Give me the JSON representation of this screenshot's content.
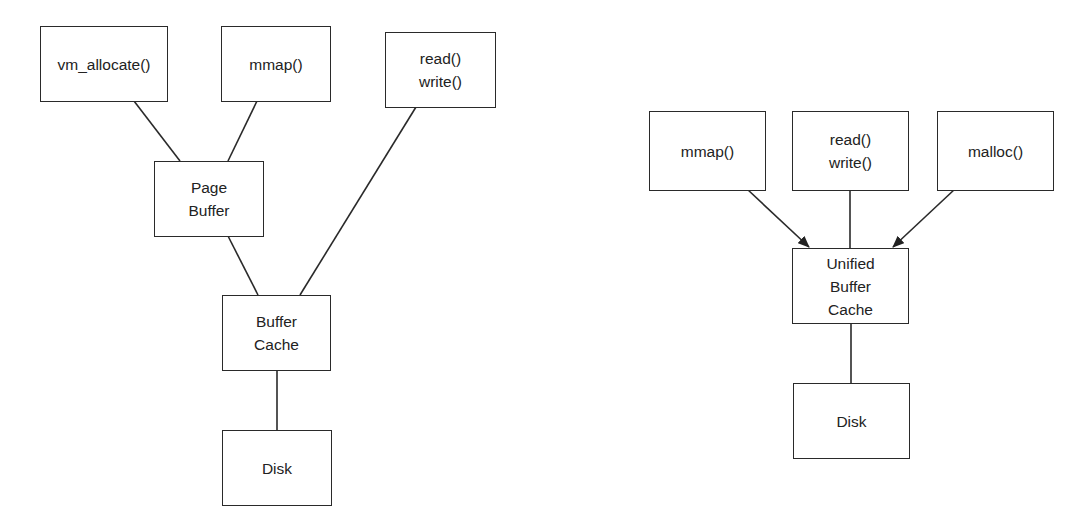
{
  "left_diagram": {
    "nodes": {
      "vm_allocate": {
        "label": "vm_allocate()",
        "x": 40,
        "y": 26,
        "w": 128,
        "h": 76
      },
      "mmap": {
        "label": "mmap()",
        "x": 221,
        "y": 26,
        "w": 110,
        "h": 76
      },
      "readwrite": {
        "label1": "read()",
        "label2": "write()",
        "x": 385,
        "y": 32,
        "w": 111,
        "h": 76
      },
      "page_buffer": {
        "label1": "Page",
        "label2": "Buffer",
        "x": 154,
        "y": 161,
        "w": 110,
        "h": 76
      },
      "buffer_cache": {
        "label1": "Buffer",
        "label2": "Cache",
        "x": 222,
        "y": 295,
        "w": 109,
        "h": 76
      },
      "disk": {
        "label": "Disk",
        "x": 222,
        "y": 430,
        "w": 110,
        "h": 76
      }
    }
  },
  "right_diagram": {
    "nodes": {
      "mmap": {
        "label": "mmap()",
        "x": 649,
        "y": 111,
        "w": 117,
        "h": 80
      },
      "readwrite": {
        "label1": "read()",
        "label2": "write()",
        "x": 792,
        "y": 111,
        "w": 117,
        "h": 80
      },
      "malloc": {
        "label": "malloc()",
        "x": 937,
        "y": 111,
        "w": 117,
        "h": 80
      },
      "unified": {
        "label1": "Unified",
        "label2": "Buffer",
        "label3": "Cache",
        "x": 792,
        "y": 248,
        "w": 117,
        "h": 76
      },
      "disk": {
        "label": "Disk",
        "x": 793,
        "y": 383,
        "w": 117,
        "h": 76
      }
    }
  }
}
